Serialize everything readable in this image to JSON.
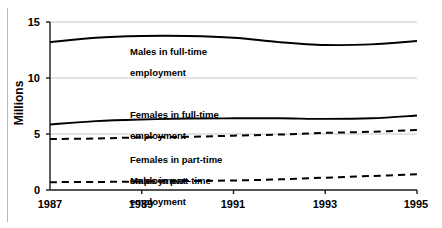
{
  "chart_data": {
    "type": "line",
    "title": "",
    "xlabel": "",
    "ylabel": "Millions",
    "xlim": [
      1987,
      1995
    ],
    "ylim": [
      0,
      15
    ],
    "yticks": [
      0,
      5,
      10,
      15
    ],
    "xticks": [
      1987,
      1989,
      1991,
      1993,
      1995
    ],
    "grid": "horizontal-gridlines-at-5-10-15",
    "legend": "inline-labels",
    "x": [
      1987,
      1988,
      1989,
      1990,
      1991,
      1992,
      1993,
      1994,
      1995
    ],
    "series": [
      {
        "name": "Males in full-time employment",
        "style": "solid",
        "color": "#000000",
        "values": [
          13.2,
          13.6,
          13.75,
          13.75,
          13.6,
          13.2,
          12.95,
          13.0,
          13.3
        ]
      },
      {
        "name": "Females in full-time employment",
        "style": "solid",
        "color": "#000000",
        "values": [
          5.85,
          6.15,
          6.3,
          6.38,
          6.4,
          6.4,
          6.35,
          6.4,
          6.65
        ]
      },
      {
        "name": "Females in part-time employment",
        "style": "dashed",
        "color": "#000000",
        "values": [
          4.55,
          4.6,
          4.7,
          4.75,
          4.85,
          4.95,
          5.1,
          5.2,
          5.35
        ]
      },
      {
        "name": "Males in part-time employment",
        "style": "dashed",
        "color": "#000000",
        "values": [
          0.7,
          0.72,
          0.75,
          0.8,
          0.85,
          0.95,
          1.1,
          1.25,
          1.4
        ]
      }
    ],
    "annotations": [
      {
        "text": "Males in full-time\nemployment",
        "x": 1989.0,
        "y": 13.3
      },
      {
        "text": "Females in full-time\nemployment",
        "x": 1989.0,
        "y": 8.1
      },
      {
        "text": "Females in part-time\nemployment",
        "x": 1989.0,
        "y": 4.1
      },
      {
        "text": "Males in part-time\nemployment",
        "x": 1989.0,
        "y": 2.7
      }
    ],
    "colors": {
      "line": "#000000",
      "gridline": "#c8c8c8",
      "axis": "#1a1a1a",
      "background": "#ffffff"
    }
  },
  "axis": {
    "y_title": "Millions",
    "y_tick_labels": [
      "15",
      "10",
      "5",
      "0"
    ],
    "x_tick_labels": [
      "1987",
      "1989",
      "1991",
      "1993",
      "1995"
    ]
  },
  "labels": {
    "males_full_line1": "Males in full-time",
    "males_full_line2": "employment",
    "females_full_line1": "Females in full-time",
    "females_full_line2": "employment",
    "females_part_line1": "Females in part-time",
    "females_part_line2": "employment",
    "males_part_line1": "Males in part-time",
    "males_part_line2": "employment"
  }
}
